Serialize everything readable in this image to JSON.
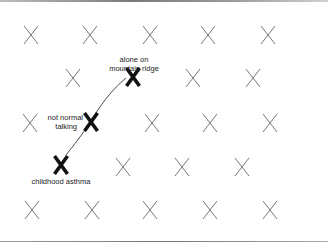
{
  "diagram": {
    "grid_marks": [
      {
        "x": 31,
        "y": 35
      },
      {
        "x": 90,
        "y": 35
      },
      {
        "x": 150,
        "y": 35
      },
      {
        "x": 208,
        "y": 35
      },
      {
        "x": 268,
        "y": 35
      },
      {
        "x": 73,
        "y": 78
      },
      {
        "x": 193,
        "y": 78
      },
      {
        "x": 253,
        "y": 78
      },
      {
        "x": 30,
        "y": 123
      },
      {
        "x": 152,
        "y": 123
      },
      {
        "x": 210,
        "y": 123
      },
      {
        "x": 270,
        "y": 123
      },
      {
        "x": 123,
        "y": 167
      },
      {
        "x": 182,
        "y": 167
      },
      {
        "x": 242,
        "y": 167
      },
      {
        "x": 32,
        "y": 210
      },
      {
        "x": 92,
        "y": 210
      },
      {
        "x": 150,
        "y": 210
      },
      {
        "x": 210,
        "y": 210
      },
      {
        "x": 270,
        "y": 210
      }
    ],
    "highlighted_marks": [
      {
        "id": "childhood-asthma",
        "x": 61,
        "y": 165,
        "label": "childhood asthma"
      },
      {
        "id": "not-normal-talking",
        "x": 91,
        "y": 122,
        "label_line1": "not normal",
        "label_line2": "talking"
      },
      {
        "id": "mountain-ridge",
        "x": 133,
        "y": 77,
        "label_line1": "alone on",
        "label_line2": "mountain ridge"
      }
    ],
    "path": "childhood asthma → not normal talking → alone on mountain ridge",
    "colors": {
      "grid_mark": "#777777",
      "highlight_mark": "#111111",
      "path_line": "#333333"
    }
  },
  "labels": {
    "asthma": "childhood asthma",
    "talking_1": "not normal",
    "talking_2": "talking",
    "ridge_1": "alone on",
    "ridge_2": "mountain ridge"
  }
}
